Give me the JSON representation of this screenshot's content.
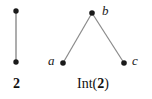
{
  "figure": {
    "background_color": "#ffffff",
    "edge_color": "#808080",
    "node_color": "#1a1a1a",
    "left_diagram": {
      "caption_text": "2",
      "caption_bold": true,
      "nodes": [
        {
          "id": "top",
          "label": "",
          "x": 16,
          "y": 11
        },
        {
          "id": "bottom",
          "label": "",
          "x": 16,
          "y": 62
        }
      ],
      "edges": [
        {
          "from": "top",
          "to": "bottom"
        }
      ]
    },
    "right_diagram": {
      "caption_prefix": "Int(",
      "caption_bold_arg": "2",
      "caption_suffix": ")",
      "nodes": [
        {
          "id": "b",
          "label": "b",
          "x": 92,
          "y": 13
        },
        {
          "id": "a",
          "label": "a",
          "x": 63,
          "y": 63
        },
        {
          "id": "c",
          "label": "c",
          "x": 124,
          "y": 63
        }
      ],
      "edges": [
        {
          "from": "a",
          "to": "b"
        },
        {
          "from": "b",
          "to": "c"
        }
      ]
    }
  }
}
